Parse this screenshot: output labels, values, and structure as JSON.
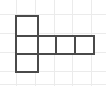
{
  "figure": {
    "canvas": {
      "width": 106,
      "height": 86,
      "background_color": "#ffffff"
    },
    "style": {
      "shape_stroke_color": "#4a4a4a",
      "shape_stroke_width": 2,
      "shape_fill_color": "#ffffff",
      "grid_line_color": "#ebebeb",
      "grid_line_width": 1
    },
    "grid": {
      "origin_x": 16,
      "origin_y": 16,
      "cell_width": 19,
      "cell_height": 19,
      "columns": 5,
      "rows": 4,
      "faint_vertical_x": [
        16,
        35,
        54,
        72,
        91
      ],
      "faint_horizontal_y": [
        14,
        33,
        52,
        71,
        84
      ]
    },
    "cells": [
      {
        "name": "cell-top-left",
        "col": 0,
        "row": 0,
        "x": 16,
        "y": 16,
        "w": 22,
        "h": 20
      },
      {
        "name": "cell-middle-left",
        "col": 0,
        "row": 1,
        "x": 16,
        "y": 36,
        "w": 22,
        "h": 18
      },
      {
        "name": "cell-bottom-left",
        "col": 0,
        "row": 2,
        "x": 16,
        "y": 54,
        "w": 22,
        "h": 18
      },
      {
        "name": "cell-middle-second",
        "col": 1,
        "row": 1,
        "x": 38,
        "y": 36,
        "w": 18,
        "h": 18
      },
      {
        "name": "cell-middle-third",
        "col": 2,
        "row": 1,
        "x": 56,
        "y": 36,
        "w": 19,
        "h": 18
      },
      {
        "name": "cell-middle-fourth",
        "col": 3,
        "row": 1,
        "x": 75,
        "y": 36,
        "w": 19,
        "h": 18
      }
    ],
    "counts": {
      "total_cells": "6",
      "vertical_column_cells": "3",
      "horizontal_row_cells": "4"
    },
    "bounds": {
      "left": 16,
      "top": 16,
      "right": 94,
      "bottom": 72
    }
  }
}
